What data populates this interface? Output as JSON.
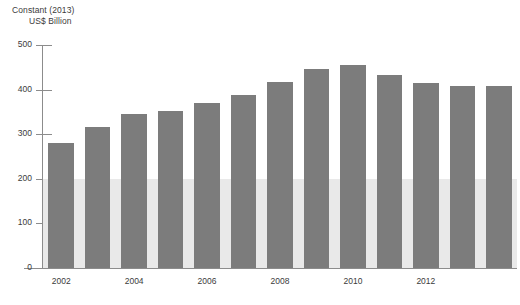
{
  "chart_data": {
    "type": "bar",
    "title": "",
    "subtitle": "",
    "ylabel_line1": "Constant (2013)",
    "ylabel_line2": "US$ Billion",
    "xlabel": "",
    "categories": [
      "2002",
      "2003",
      "2004",
      "2005",
      "2006",
      "2007",
      "2008",
      "2009",
      "2010",
      "2011",
      "2012",
      "2013",
      "2014"
    ],
    "values": [
      280,
      317,
      345,
      353,
      370,
      389,
      416,
      447,
      455,
      433,
      414,
      407,
      407
    ],
    "x_tick_labels": [
      "2002",
      "2004",
      "2006",
      "2008",
      "2010",
      "2012"
    ],
    "x_tick_categories": [
      "2002",
      "2004",
      "2006",
      "2008",
      "2010",
      "2012"
    ],
    "y_ticks": [
      0,
      100,
      200,
      300,
      400,
      500
    ],
    "ylim": [
      0,
      500
    ],
    "grid": false,
    "legend": null,
    "legend_position": "none",
    "bar_color": "#7c7c7c",
    "band_color": "#e9e9e9",
    "band_range": [
      0,
      200
    ],
    "axis_color": "#8c8c8c",
    "text_color": "#3b3b3b",
    "background": "#ffffff"
  }
}
